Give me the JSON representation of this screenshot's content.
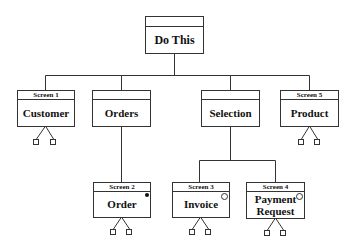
{
  "diagram": {
    "root": {
      "title": "Do This",
      "header": ""
    },
    "level1": [
      {
        "id": "customer",
        "header": "Screen 1",
        "label": "Customer",
        "children_marker": "two-squares"
      },
      {
        "id": "orders",
        "header": "",
        "label": "Orders"
      },
      {
        "id": "selection",
        "header": "",
        "label": "Selection"
      },
      {
        "id": "product",
        "header": "Screen 5",
        "label": "Product",
        "children_marker": "two-squares"
      }
    ],
    "level2": [
      {
        "id": "order",
        "parent": "Orders",
        "header": "Screen 2",
        "label": "Order",
        "corner_marker": "filled-dot",
        "children_marker": "two-squares"
      },
      {
        "id": "invoice",
        "parent": "Selection",
        "header": "Screen 3",
        "label": "Invoice",
        "corner_marker": "open-circle",
        "children_marker": "two-squares"
      },
      {
        "id": "payment-request",
        "parent": "Selection",
        "header": "Screen 4",
        "label": "Payment Request",
        "label_lines": [
          "Payment",
          "Request"
        ],
        "corner_marker": "open-circle",
        "children_marker": "two-squares"
      }
    ]
  }
}
